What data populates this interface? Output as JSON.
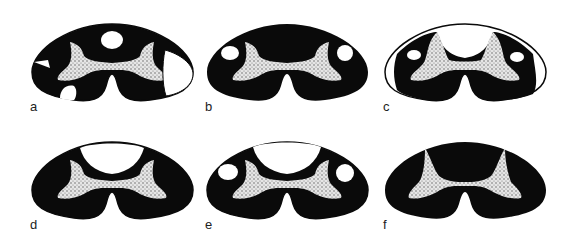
{
  "figure": {
    "colors": {
      "white_matter": "#0a0a0a",
      "lesion": "#ffffff",
      "gray_matter": "#d8d8d8",
      "background": "#ffffff"
    },
    "panels": [
      {
        "id": "a",
        "label": "a"
      },
      {
        "id": "b",
        "label": "b"
      },
      {
        "id": "c",
        "label": "c"
      },
      {
        "id": "d",
        "label": "d"
      },
      {
        "id": "e",
        "label": "e"
      },
      {
        "id": "f",
        "label": "f"
      }
    ]
  }
}
